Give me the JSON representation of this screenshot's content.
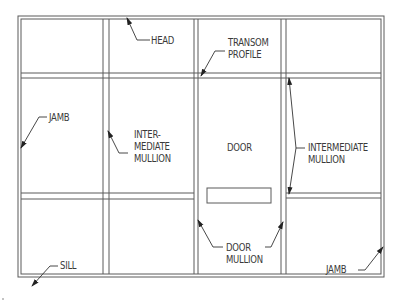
{
  "diagram": {
    "colors": {
      "line": "#5a5a5a",
      "text": "#3a3a3a",
      "background": "#ffffff"
    },
    "labels": {
      "head": "HEAD",
      "transom_profile": "TRANSOM\nPROFILE",
      "jamb_left": "JAMB",
      "intermediate_mullion_left": "INTER-\nMEDIATE\nMULLION",
      "door": "DOOR",
      "intermediate_mullion_right": "INTERMEDIATE\nMULLION",
      "sill": "SILL",
      "door_mullion": "DOOR\nMULLION",
      "jamb_right": "JAMB"
    }
  }
}
